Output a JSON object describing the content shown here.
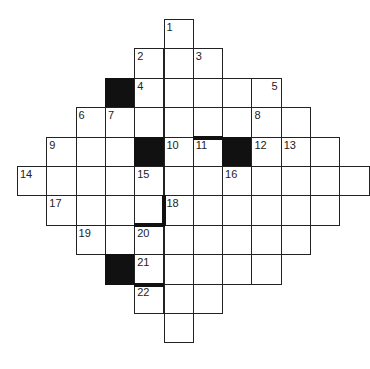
{
  "puzzle": {
    "type": "crossword",
    "shape": "diamond",
    "grid_rows": 11,
    "grid_cols": 12,
    "origin": {
      "x": 17,
      "y": 19
    },
    "cell_size": {
      "w": 29.3,
      "h": 29.4
    },
    "colors": {
      "line": "#222222",
      "block": "#111111",
      "cell": "#ffffff"
    },
    "rows": [
      {
        "row": 0,
        "cols": [
          5
        ]
      },
      {
        "row": 1,
        "cols": [
          4,
          5,
          6
        ]
      },
      {
        "row": 2,
        "cols": [
          3,
          4,
          5,
          6,
          7,
          8
        ]
      },
      {
        "row": 3,
        "cols": [
          2,
          3,
          4,
          5,
          6,
          7,
          8,
          9
        ]
      },
      {
        "row": 4,
        "cols": [
          1,
          2,
          3,
          4,
          5,
          6,
          7,
          8,
          9,
          10
        ]
      },
      {
        "row": 5,
        "cols": [
          0,
          1,
          2,
          3,
          4,
          5,
          6,
          7,
          8,
          9,
          10,
          11
        ]
      },
      {
        "row": 6,
        "cols": [
          1,
          2,
          3,
          4,
          5,
          6,
          7,
          8,
          9,
          10
        ]
      },
      {
        "row": 7,
        "cols": [
          2,
          3,
          4,
          5,
          6,
          7,
          8,
          9
        ]
      },
      {
        "row": 8,
        "cols": [
          3,
          4,
          5,
          6,
          7,
          8
        ]
      },
      {
        "row": 9,
        "cols": [
          4,
          5,
          6
        ]
      },
      {
        "row": 10,
        "cols": [
          5
        ]
      }
    ],
    "black_cells": [
      {
        "row": 2,
        "col": 3
      },
      {
        "row": 4,
        "col": 4
      },
      {
        "row": 4,
        "col": 7
      },
      {
        "row": 8,
        "col": 3
      }
    ],
    "thick_bars": [
      {
        "row": 4,
        "col": 6,
        "side": "top"
      },
      {
        "row": 6,
        "col": 4,
        "side": "right"
      },
      {
        "row": 6,
        "col": 4,
        "side": "bottom"
      },
      {
        "row": 9,
        "col": 4,
        "side": "top"
      }
    ],
    "numbers": [
      {
        "n": "1",
        "row": 0,
        "col": 5
      },
      {
        "n": "2",
        "row": 1,
        "col": 4
      },
      {
        "n": "3",
        "row": 1,
        "col": 6
      },
      {
        "n": "4",
        "row": 2,
        "col": 4
      },
      {
        "n": "5",
        "row": 2,
        "col": 8,
        "align": "right"
      },
      {
        "n": "6",
        "row": 3,
        "col": 2
      },
      {
        "n": "7",
        "row": 3,
        "col": 3
      },
      {
        "n": "8",
        "row": 3,
        "col": 8
      },
      {
        "n": "9",
        "row": 4,
        "col": 1
      },
      {
        "n": "10",
        "row": 4,
        "col": 5
      },
      {
        "n": "11",
        "row": 4,
        "col": 6
      },
      {
        "n": "12",
        "row": 4,
        "col": 8
      },
      {
        "n": "13",
        "row": 4,
        "col": 9
      },
      {
        "n": "14",
        "row": 5,
        "col": 0
      },
      {
        "n": "15",
        "row": 5,
        "col": 4
      },
      {
        "n": "16",
        "row": 5,
        "col": 7
      },
      {
        "n": "17",
        "row": 6,
        "col": 1
      },
      {
        "n": "18",
        "row": 6,
        "col": 5
      },
      {
        "n": "19",
        "row": 7,
        "col": 2
      },
      {
        "n": "20",
        "row": 7,
        "col": 4
      },
      {
        "n": "21",
        "row": 8,
        "col": 4
      },
      {
        "n": "22",
        "row": 9,
        "col": 4
      }
    ]
  }
}
